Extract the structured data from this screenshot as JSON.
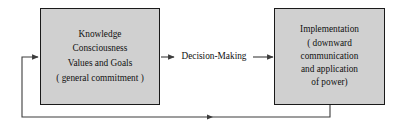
{
  "diagram": {
    "type": "flowchart-feedback-loop",
    "background_color": "#ffffff",
    "node_fill_color": "#d0d0d0",
    "node_border_color": "#1a1a1a",
    "line_color": "#3c3c3c",
    "nodes": [
      {
        "id": "knowledge",
        "lines": [
          "Knowledge",
          "Consciousness",
          "Values and Goals",
          "( general commitment )"
        ]
      },
      {
        "id": "implementation",
        "lines": [
          "Implementation",
          "( downward",
          "communication",
          "and application",
          "of power)"
        ]
      }
    ],
    "edges": [
      {
        "id": "decision-making",
        "label": "Decision-Making",
        "from": "knowledge",
        "to": "implementation",
        "direction": "forward"
      },
      {
        "id": "feedback-loop",
        "label": "",
        "from": "implementation",
        "to": "knowledge",
        "direction": "return"
      }
    ]
  }
}
